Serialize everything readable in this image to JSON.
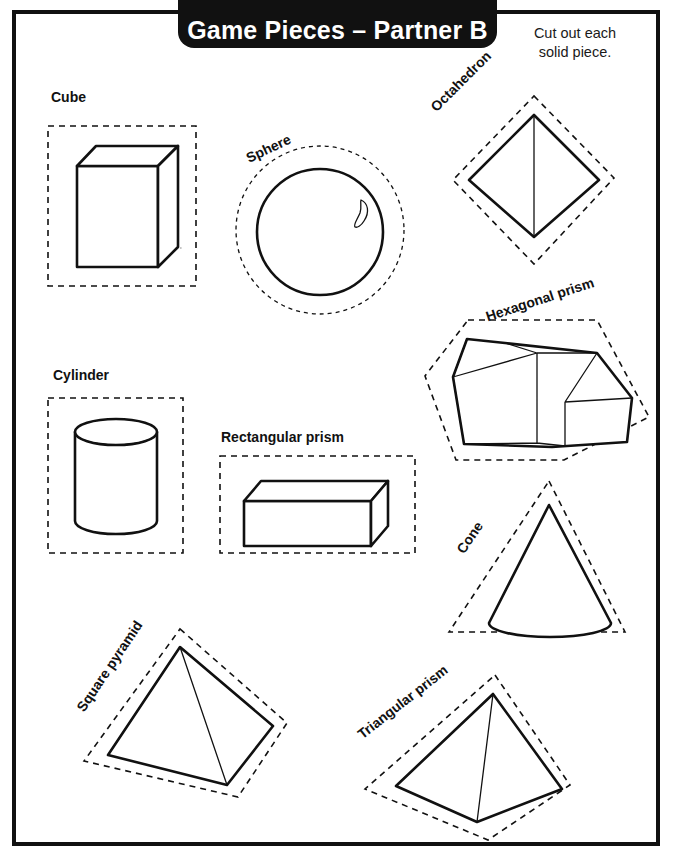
{
  "header": {
    "title": "Game Pieces – Partner B",
    "instructions_line1": "Cut out each",
    "instructions_line2": "solid piece."
  },
  "shapes": [
    {
      "id": "cube",
      "label": "Cube",
      "cut_outline": "square",
      "label_rotation_deg": 0
    },
    {
      "id": "sphere",
      "label": "Sphere",
      "cut_outline": "circle",
      "label_rotation_deg": -25
    },
    {
      "id": "octahedron",
      "label": "Octahedron",
      "cut_outline": "diamond",
      "label_rotation_deg": -45
    },
    {
      "id": "hexagonal-prism",
      "label": "Hexagonal prism",
      "cut_outline": "hexagon",
      "label_rotation_deg": -18
    },
    {
      "id": "cylinder",
      "label": "Cylinder",
      "cut_outline": "rectangle",
      "label_rotation_deg": 0
    },
    {
      "id": "rectangular-prism",
      "label": "Rectangular prism",
      "cut_outline": "rectangle",
      "label_rotation_deg": 0
    },
    {
      "id": "cone",
      "label": "Cone",
      "cut_outline": "triangle",
      "label_rotation_deg": -56
    },
    {
      "id": "square-pyramid",
      "label": "Square pyramid",
      "cut_outline": "rotated-square",
      "label_rotation_deg": -56
    },
    {
      "id": "triangular-prism",
      "label": "Triangular prism",
      "cut_outline": "rotated-square",
      "label_rotation_deg": -38
    }
  ],
  "colors": {
    "ink": "#111111",
    "paper": "#ffffff",
    "hidden_edge": "#8a8a8a",
    "banner_background": "#111111",
    "banner_text": "#ffffff"
  }
}
